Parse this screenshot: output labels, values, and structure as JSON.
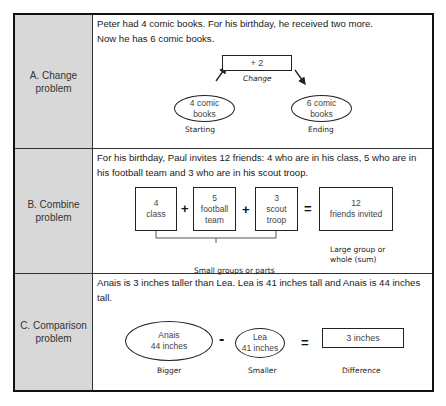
{
  "rows": [
    {
      "label_line1": "A. Change",
      "label_line2": "problem",
      "text_line1": "Peter had 4 comic books. For his birthday, he received two more.",
      "text_line2": "Now he has 6 comic books.",
      "diagram": {
        "change_box": "+ 2",
        "change_caption": "Change",
        "start_oval_line1": "4 comic",
        "start_oval_line2": "books",
        "start_caption": "Starting",
        "end_oval_line1": "6 comic",
        "end_oval_line2": "books",
        "end_caption": "Ending"
      }
    },
    {
      "label_line1": "B. Combine",
      "label_line2": "problem",
      "text_line1": "For his birthday, Paul invites 12 friends: 4 who are in his class, 5 who are in",
      "text_line2": "his football team and 3 who are in his scout troop.",
      "diagram": {
        "part1_line1": "4",
        "part1_line2": "class",
        "part2_line1": "5",
        "part2_line2": "football",
        "part2_line3": "team",
        "part3_line1": "3",
        "part3_line2": "scout",
        "part3_line3": "troop",
        "plus1": "+",
        "plus2": "+",
        "equals": "=",
        "whole_line1": "12",
        "whole_line2": "friends invited",
        "parts_caption": "Small groups or parts",
        "whole_caption_line1": "Large group or",
        "whole_caption_line2": "whole (sum)"
      }
    },
    {
      "label_line1": "C. Comparison",
      "label_line2": "problem",
      "text_line1": "Anais is 3 inches taller than Lea. Lea is 41 inches tall and Anais is 44 inches",
      "text_line2": "tall.",
      "diagram": {
        "bigger_oval_line1": "Anais",
        "bigger_oval_line2": "44 inches",
        "bigger_caption": "Bigger",
        "minus": "-",
        "smaller_oval_line1": "Lea",
        "smaller_oval_line2": "41 inches",
        "smaller_caption": "Smaller",
        "equals": "=",
        "difference_box": "3 inches",
        "difference_caption": "Difference"
      }
    }
  ]
}
